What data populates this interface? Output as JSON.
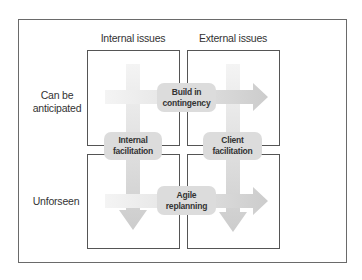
{
  "diagram": {
    "columns": [
      {
        "label": "Internal issues"
      },
      {
        "label": "External issues"
      }
    ],
    "rows": [
      {
        "label_line1": "Can be",
        "label_line2": "anticipated"
      },
      {
        "label_line1": "Unforseen",
        "label_line2": ""
      }
    ],
    "strategies": {
      "build_in_contingency": {
        "line1": "Build in",
        "line2": "contingency"
      },
      "internal_facilitation": {
        "line1": "Internal",
        "line2": "facilitation"
      },
      "client_facilitation": {
        "line1": "Client",
        "line2": "facilitation"
      },
      "agile_replanning": {
        "line1": "Agile",
        "line2": "replanning"
      }
    },
    "colors": {
      "arrow_light": "#ececec",
      "arrow_dark": "#cfcfcf",
      "pill": "#dcdcdc",
      "border": "#555555"
    }
  }
}
